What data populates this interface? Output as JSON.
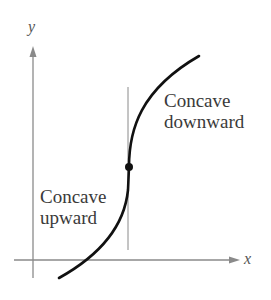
{
  "figure": {
    "axes": {
      "x_label": "x",
      "y_label": "y"
    },
    "annotations": {
      "upper_right": {
        "line1": "Concave",
        "line2": "downward"
      },
      "lower_left": {
        "line1": "Concave",
        "line2": "upward"
      }
    },
    "features": [
      "inflection point marked with dot",
      "vertical line through inflection point"
    ],
    "colors": {
      "curve": "#111111",
      "axes": "#8a8a8a",
      "text": "#3a3a3a"
    }
  }
}
